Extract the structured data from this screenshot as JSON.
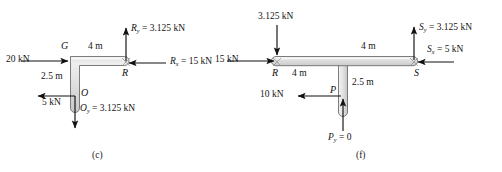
{
  "figure": {
    "panels": [
      {
        "id": "c",
        "caption": "(c)",
        "shape": "L-bracket",
        "points": [
          {
            "name": "G",
            "label": "G"
          },
          {
            "name": "R",
            "label": "R"
          },
          {
            "name": "O",
            "label": "O"
          }
        ],
        "dimensions": [
          {
            "name": "top-length",
            "label": "4 m"
          },
          {
            "name": "vertical-length",
            "label": "2.5 m"
          }
        ],
        "forces": [
          {
            "name": "applied-load-left",
            "label": "20 kN",
            "direction": "right"
          },
          {
            "name": "reaction-Ry",
            "label": "R",
            "sub": "y",
            "value": "= 3.125 kN",
            "direction": "up"
          },
          {
            "name": "reaction-Rx",
            "label": "R",
            "sub": "x",
            "value": "= 15 kN",
            "direction": "left"
          },
          {
            "name": "shear-at-O",
            "label": "5 kN",
            "direction": "left"
          },
          {
            "name": "reaction-Oy",
            "label": "O",
            "sub": "y",
            "value": "= 3.125 kN",
            "direction": "down"
          }
        ]
      },
      {
        "id": "f",
        "caption": "(f)",
        "shape": "T-bracket",
        "points": [
          {
            "name": "R",
            "label": "R"
          },
          {
            "name": "S",
            "label": "S"
          },
          {
            "name": "P",
            "label": "P"
          }
        ],
        "dimensions": [
          {
            "name": "left-length",
            "label": "4 m"
          },
          {
            "name": "right-length",
            "label": "4 m"
          },
          {
            "name": "stem-length",
            "label": "2.5 m"
          }
        ],
        "forces": [
          {
            "name": "load-top-at-R",
            "label": "3.125 kN",
            "direction": "down"
          },
          {
            "name": "load-left-at-R",
            "label": "15 kN",
            "direction": "right"
          },
          {
            "name": "reaction-Sy",
            "label": "S",
            "sub": "y",
            "value": "= 3.125 kN",
            "direction": "up"
          },
          {
            "name": "reaction-Sx",
            "label": "S",
            "sub": "x",
            "value": "= 5 kN",
            "direction": "left"
          },
          {
            "name": "load-at-P",
            "label": "10 kN",
            "direction": "left"
          },
          {
            "name": "reaction-Py",
            "label": "P",
            "sub": "y",
            "value": "= 0",
            "direction": "up"
          }
        ]
      }
    ],
    "colors": {
      "bar_fill": "#d9d9d9",
      "bar_fill_light": "#eeeeee",
      "bar_stroke": "#6b6b6b",
      "arrow": "#111111",
      "text": "#141414"
    }
  }
}
